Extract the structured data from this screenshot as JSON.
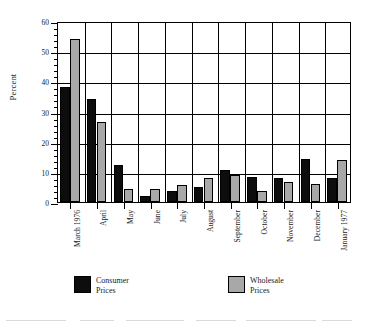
{
  "chart_data": {
    "type": "bar",
    "title": "",
    "xlabel": "",
    "ylabel": "Percent",
    "ylim": [
      0,
      60
    ],
    "ytick_step": 10,
    "yminor_step": 2,
    "grid": "both",
    "legend_position": "bottom",
    "yticks": [
      "0",
      "10",
      "20",
      "30",
      "40",
      "50",
      "60"
    ],
    "categories": [
      "March 1976",
      "April",
      "May",
      "June",
      "July",
      "August",
      "September",
      "October",
      "November",
      "December",
      "January 1977"
    ],
    "series": [
      {
        "name": "Consumer Prices",
        "color": "#0d0d0d",
        "values": [
          38.0,
          34.2,
          12.3,
          2.1,
          3.7,
          5.1,
          10.6,
          8.4,
          8.0,
          14.4,
          8.0
        ]
      },
      {
        "name": "Wholesale Prices",
        "color": "#a8a8a8",
        "values": [
          54.0,
          26.6,
          4.3,
          4.3,
          5.6,
          8.0,
          8.8,
          3.7,
          6.5,
          6.0,
          13.8
        ]
      }
    ]
  },
  "legend": {
    "items": [
      {
        "label_line1": "Consumer",
        "label_line2": "Prices"
      },
      {
        "label_line1": "Wholesale",
        "label_line2": "Prices"
      }
    ]
  }
}
